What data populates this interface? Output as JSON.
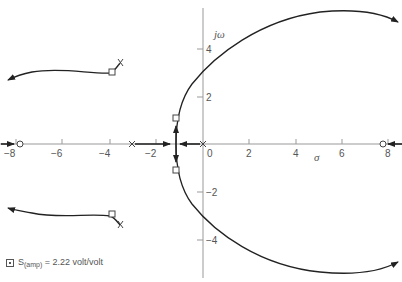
{
  "diagram": {
    "type": "root-locus",
    "axes": {
      "x_label": "σ",
      "y_label": "jω",
      "x_ticks": [
        "−8",
        "−6",
        "−4",
        "−2",
        "0",
        "2",
        "4",
        "6",
        "8"
      ],
      "y_ticks": [
        "4",
        "2",
        "−2",
        "−4"
      ]
    },
    "poles": [
      {
        "sigma": -3,
        "omega": 0
      },
      {
        "sigma": 0,
        "omega": 0
      },
      {
        "sigma": -3.9,
        "omega": 3.2
      },
      {
        "sigma": -3.9,
        "omega": -3.2
      }
    ],
    "zeros": [
      {
        "sigma": -7.8,
        "omega": 0
      },
      {
        "sigma": 7.8,
        "omega": 0
      }
    ],
    "operating_points": [
      {
        "sigma": -1.2,
        "omega": 1.1
      },
      {
        "sigma": -1.2,
        "omega": -1.1
      },
      {
        "sigma": -4.1,
        "omega": 3.0
      },
      {
        "sigma": -4.1,
        "omega": -3.0
      }
    ],
    "legend": {
      "symbol": "□",
      "label_main": "S",
      "label_sub": "(amp)",
      "label_rest": " = 2.22 volt/volt"
    }
  }
}
